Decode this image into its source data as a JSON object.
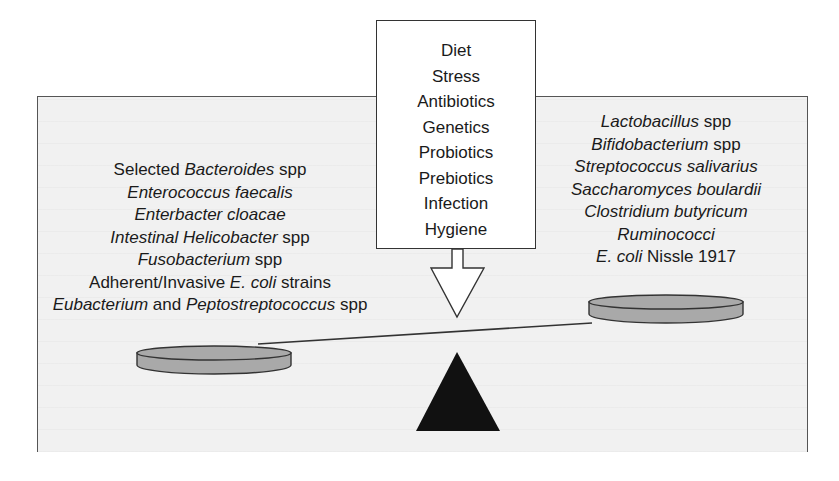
{
  "diagram": {
    "type": "balance-scale",
    "factors_box": {
      "items": [
        "Diet",
        "Stress",
        "Antibiotics",
        "Genetics",
        "Probiotics",
        "Prebiotics",
        "Infection",
        "Hygiene"
      ]
    },
    "left_pan": {
      "items": [
        {
          "pre": "Selected ",
          "italic": "Bacteroides",
          "post": " spp"
        },
        {
          "pre": "",
          "italic": "Enterococcus faecalis",
          "post": ""
        },
        {
          "pre": "",
          "italic": "Enterbacter cloacae",
          "post": ""
        },
        {
          "pre": "",
          "italic": "Intestinal Helicobacter",
          "post": " spp"
        },
        {
          "pre": "",
          "italic": "Fusobacterium",
          "post": " spp"
        },
        {
          "pre": "Adherent/Invasive ",
          "italic": "E. coli",
          "post": " strains"
        },
        {
          "pre": "",
          "italic": "Eubacterium",
          "post": " and ",
          "italic2": "Peptostreptococcus",
          "post2": " spp"
        }
      ]
    },
    "right_pan": {
      "items": [
        {
          "pre": "",
          "italic": "Lactobacillus",
          "post": " spp"
        },
        {
          "pre": "",
          "italic": "Bifidobacterium",
          "post": " spp"
        },
        {
          "pre": "",
          "italic": "Streptococcus salivarius",
          "post": ""
        },
        {
          "pre": "",
          "italic": "Saccharomyces boulardii",
          "post": ""
        },
        {
          "pre": "",
          "italic": "Clostridium butyricum",
          "post": ""
        },
        {
          "pre": "",
          "italic": "Ruminococci",
          "post": ""
        },
        {
          "pre": "",
          "italic": "E. coli",
          "post": " Nissle 1917"
        }
      ]
    },
    "colors": {
      "panel_bg": "#f1f1f1",
      "pan_fill": "#a9a9a9",
      "fulcrum": "#111111",
      "stroke": "#333333"
    }
  }
}
